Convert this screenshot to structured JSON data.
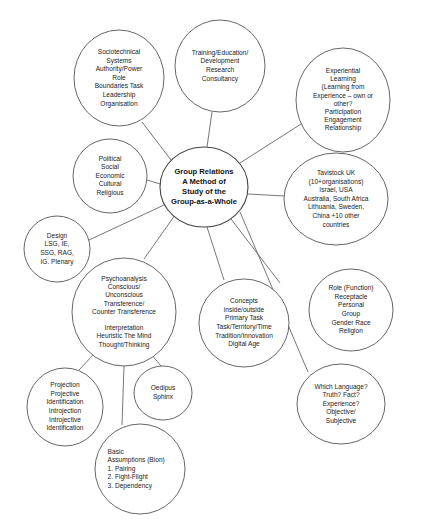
{
  "diagram": {
    "background_color": "#ffffff",
    "node_stroke_color": "#555555",
    "connector_color": "#666666",
    "text_color": "#222222"
  },
  "center": {
    "name": "group-relations-center",
    "lines": [
      "Group Relations",
      "A Method of",
      "Study of the",
      "Group-as-a-Whole"
    ],
    "cx": 204,
    "cy": 187,
    "rx": 44,
    "ry": 40
  },
  "nodes": [
    {
      "name": "sociotechnical-systems",
      "lines": [
        "Sociotechnical",
        "Systems",
        "Authority/Power",
        "Role",
        "Boundaries Task",
        "Leadership",
        "Organisation"
      ],
      "cx": 119,
      "cy": 78,
      "rx": 45,
      "ry": 48,
      "align": "center"
    },
    {
      "name": "training-education",
      "lines": [
        "Training/Education/",
        "Development",
        "Research",
        "Consultancy"
      ],
      "cx": 220,
      "cy": 66,
      "rx": 45,
      "ry": 46,
      "align": "center"
    },
    {
      "name": "experiential-learning",
      "lines": [
        "Experiential",
        "Learning",
        "(Learning from",
        "Experience – own or",
        "other?",
        "Participation",
        "Engagement",
        "Relationship"
      ],
      "cx": 343,
      "cy": 100,
      "rx": 47,
      "ry": 52,
      "align": "center"
    },
    {
      "name": "political-social",
      "lines": [
        "Political",
        "Social",
        "Economic",
        "Cultural",
        "Religious"
      ],
      "cx": 110,
      "cy": 176,
      "rx": 37,
      "ry": 37,
      "align": "center"
    },
    {
      "name": "tavistock-uk",
      "lines": [
        "Tavistock UK",
        "(10+organisations)",
        "Israel, USA",
        "Australia, South Africa",
        "Lithuania, Sweden,",
        "China +10 other",
        "countries"
      ],
      "cx": 336,
      "cy": 199,
      "rx": 52,
      "ry": 46,
      "align": "center"
    },
    {
      "name": "design-events",
      "lines": [
        "Design",
        "LSG, IE,",
        "SSG, RAG,",
        "IG. Plenary"
      ],
      "cx": 57,
      "cy": 249,
      "rx": 33,
      "ry": 33,
      "align": "center"
    },
    {
      "name": "psychoanalysis",
      "lines": [
        "Psychoanalysis",
        "Conscious/",
        "Unconscious",
        "Transference/",
        "Counter Transference",
        "",
        "Interpretation",
        "Heuristic The Mind",
        "Thought/Thinking"
      ],
      "cx": 124,
      "cy": 312,
      "rx": 52,
      "ry": 54,
      "align": "center"
    },
    {
      "name": "concepts",
      "lines": [
        "Concepts",
        "inside/outside",
        "Primary Task",
        "Task/Territory/Time",
        "Tradition/Innovation",
        "Digital Age"
      ],
      "cx": 244,
      "cy": 323,
      "rx": 45,
      "ry": 44,
      "align": "center"
    },
    {
      "name": "role-function",
      "lines": [
        "Role (Function)",
        "Receptacle",
        "Personal",
        "Group",
        "Gender Race",
        "Religion"
      ],
      "cx": 351,
      "cy": 310,
      "rx": 42,
      "ry": 41,
      "align": "center"
    },
    {
      "name": "projection-identification",
      "lines": [
        "Projection",
        "Projective",
        "Identification",
        "Introjection",
        "Introjective",
        "Identification"
      ],
      "cx": 65,
      "cy": 407,
      "rx": 38,
      "ry": 39,
      "align": "center"
    },
    {
      "name": "oedipus-sphinx",
      "lines": [
        "Oedipus",
        "Sphinx"
      ],
      "cx": 163,
      "cy": 393,
      "rx": 29,
      "ry": 27,
      "align": "center"
    },
    {
      "name": "basic-assumptions",
      "lines": [
        "Basic",
        "Assumptions (Bion)",
        "1.  Pairing",
        "2.  Fight-Flight",
        "3.  Dependency"
      ],
      "cx": 140,
      "cy": 469,
      "rx": 45,
      "ry": 45,
      "align": "left"
    },
    {
      "name": "which-language",
      "lines": [
        "Which Language?",
        "Truth? Fact?",
        "Experience?",
        "Objective/",
        "Subjective"
      ],
      "cx": 341,
      "cy": 404,
      "rx": 44,
      "ry": 40,
      "align": "center"
    }
  ],
  "connectors": [
    {
      "name": "connector-center-to-sociotechnical",
      "x1": 171,
      "y1": 160,
      "x2": 142,
      "y2": 122
    },
    {
      "name": "connector-center-to-training",
      "x1": 207,
      "y1": 147,
      "x2": 212,
      "y2": 112
    },
    {
      "name": "connector-center-to-experiential",
      "x1": 240,
      "y1": 163,
      "x2": 301,
      "y2": 124
    },
    {
      "name": "connector-center-to-political",
      "x1": 160,
      "y1": 184,
      "x2": 147,
      "y2": 180
    },
    {
      "name": "connector-center-to-tavistock",
      "x1": 248,
      "y1": 194,
      "x2": 284,
      "y2": 196
    },
    {
      "name": "connector-center-to-design",
      "x1": 164,
      "y1": 205,
      "x2": 89,
      "y2": 240
    },
    {
      "name": "connector-center-to-psychoanalysis",
      "x1": 175,
      "y1": 215,
      "x2": 144,
      "y2": 259
    },
    {
      "name": "connector-center-to-concepts",
      "x1": 207,
      "y1": 227,
      "x2": 224,
      "y2": 280
    },
    {
      "name": "connector-center-to-role",
      "x1": 231,
      "y1": 219,
      "x2": 280,
      "y2": 283
    },
    {
      "name": "connector-center-to-which-language",
      "x1": 240,
      "y1": 212,
      "x2": 308,
      "y2": 372
    },
    {
      "name": "connector-psychoanalysis-to-projection",
      "x1": 93,
      "y1": 355,
      "x2": 79,
      "y2": 370
    },
    {
      "name": "connector-psychoanalysis-to-oedipus",
      "x1": 152,
      "y1": 355,
      "x2": 161,
      "y2": 366
    },
    {
      "name": "connector-psychoanalysis-to-basic-assumptions",
      "x1": 124,
      "y1": 366,
      "x2": 122,
      "y2": 425
    }
  ]
}
